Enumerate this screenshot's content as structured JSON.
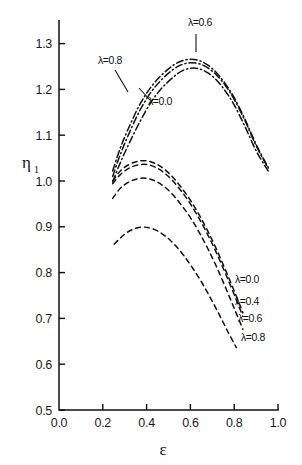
{
  "chart_data": {
    "type": "line",
    "title": "",
    "xlabel": "ε",
    "ylabel": "η",
    "ylabel_sub": "1",
    "xlim": [
      0.0,
      1.0
    ],
    "ylim": [
      0.5,
      1.35
    ],
    "xticks": [
      "0.0",
      "0.2",
      "0.4",
      "0.6",
      "0.8",
      "1.0"
    ],
    "xtick_values": [
      0.0,
      0.2,
      0.4,
      0.6,
      0.8,
      1.0
    ],
    "yticks": [
      "0.5",
      "0.6",
      "0.7",
      "0.8",
      "0.9",
      "1.0",
      "1.1",
      "1.2",
      "1.3"
    ],
    "ytick_values": [
      0.5,
      0.6,
      0.7,
      0.8,
      0.9,
      1.0,
      1.1,
      1.2,
      1.3
    ],
    "grid": false,
    "legend_position": "inline-annotations",
    "series": [
      {
        "name": "upper-lambda-0.8",
        "label": "λ=0.8",
        "style": "dash-dot",
        "group": "upper",
        "x": [
          0.245,
          0.28,
          0.32,
          0.37,
          0.42,
          0.47,
          0.52,
          0.56,
          0.6,
          0.64,
          0.68,
          0.72,
          0.76,
          0.8,
          0.85,
          0.9,
          0.955
        ],
        "y": [
          1.022,
          1.072,
          1.118,
          1.168,
          1.205,
          1.232,
          1.252,
          1.262,
          1.266,
          1.263,
          1.253,
          1.236,
          1.212,
          1.182,
          1.134,
          1.08,
          1.03
        ]
      },
      {
        "name": "upper-lambda-0.6",
        "label": "λ=0.6",
        "style": "dash-dot",
        "group": "upper",
        "x": [
          0.245,
          0.28,
          0.32,
          0.37,
          0.42,
          0.47,
          0.52,
          0.56,
          0.6,
          0.64,
          0.68,
          0.72,
          0.76,
          0.8,
          0.85,
          0.9,
          0.955
        ],
        "y": [
          1.01,
          1.058,
          1.104,
          1.155,
          1.194,
          1.222,
          1.243,
          1.254,
          1.258,
          1.256,
          1.247,
          1.231,
          1.208,
          1.178,
          1.131,
          1.077,
          1.028
        ]
      },
      {
        "name": "upper-lambda-0.0",
        "label": "λ=0.0",
        "style": "dash-dot",
        "group": "upper",
        "x": [
          0.245,
          0.28,
          0.32,
          0.37,
          0.42,
          0.47,
          0.52,
          0.56,
          0.6,
          0.64,
          0.68,
          0.72,
          0.76,
          0.8,
          0.85,
          0.9,
          0.955
        ],
        "y": [
          0.998,
          1.04,
          1.082,
          1.13,
          1.172,
          1.203,
          1.226,
          1.24,
          1.246,
          1.245,
          1.236,
          1.22,
          1.196,
          1.166,
          1.118,
          1.066,
          1.022
        ]
      },
      {
        "name": "lower-lambda-0.0",
        "label": "λ=0.0",
        "style": "dashed",
        "group": "lower",
        "x": [
          0.245,
          0.28,
          0.32,
          0.36,
          0.4,
          0.44,
          0.48,
          0.52,
          0.56,
          0.6,
          0.64,
          0.68,
          0.72,
          0.76,
          0.8,
          0.84
        ],
        "y": [
          1.0,
          1.022,
          1.036,
          1.043,
          1.044,
          1.038,
          1.026,
          1.008,
          0.985,
          0.958,
          0.926,
          0.89,
          0.85,
          0.806,
          0.76,
          0.712
        ]
      },
      {
        "name": "lower-lambda-0.4",
        "label": "λ=0.4",
        "style": "dashed",
        "group": "lower",
        "x": [
          0.245,
          0.28,
          0.32,
          0.36,
          0.4,
          0.44,
          0.48,
          0.52,
          0.56,
          0.6,
          0.64,
          0.68,
          0.72,
          0.76,
          0.8,
          0.84
        ],
        "y": [
          0.994,
          1.014,
          1.028,
          1.035,
          1.036,
          1.03,
          1.018,
          1.0,
          0.977,
          0.95,
          0.918,
          0.882,
          0.842,
          0.798,
          0.752,
          0.704
        ]
      },
      {
        "name": "lower-lambda-0.6",
        "label": "λ=0.6",
        "style": "dashed",
        "group": "lower",
        "x": [
          0.245,
          0.28,
          0.32,
          0.36,
          0.4,
          0.44,
          0.48,
          0.52,
          0.56,
          0.6,
          0.64,
          0.68,
          0.72,
          0.76,
          0.8,
          0.84
        ],
        "y": [
          0.962,
          0.984,
          0.998,
          1.005,
          1.006,
          1.0,
          0.988,
          0.97,
          0.947,
          0.92,
          0.888,
          0.852,
          0.812,
          0.768,
          0.722,
          0.676
        ]
      },
      {
        "name": "lower-lambda-0.8",
        "label": "λ=0.8",
        "style": "dashed",
        "group": "lower",
        "x": [
          0.252,
          0.29,
          0.33,
          0.37,
          0.41,
          0.45,
          0.49,
          0.53,
          0.57,
          0.61,
          0.65,
          0.69,
          0.73,
          0.77,
          0.81
        ],
        "y": [
          0.862,
          0.88,
          0.893,
          0.899,
          0.898,
          0.891,
          0.878,
          0.86,
          0.837,
          0.81,
          0.78,
          0.746,
          0.71,
          0.672,
          0.636
        ]
      }
    ],
    "annotations": [
      {
        "name": "ann-upper-lambda-0.6",
        "text": "λ=0.6",
        "x_px": 188,
        "y_px": 26,
        "leader": true
      },
      {
        "name": "ann-upper-lambda-0.8",
        "text": "λ=0.8",
        "x_px": 98,
        "y_px": 64,
        "leader": true
      },
      {
        "name": "ann-upper-lambda-0.0",
        "text": "λ=0.0",
        "x_px": 148,
        "y_px": 105,
        "leader": true
      },
      {
        "name": "ann-lower-lambda-0.0",
        "text": "λ=0.0",
        "x_px": 235,
        "y_px": 283,
        "leader": false
      },
      {
        "name": "ann-lower-lambda-0.4",
        "text": "λ=0.4",
        "x_px": 235,
        "y_px": 305,
        "leader": false
      },
      {
        "name": "ann-lower-lambda-0.6",
        "text": "λ=0.6",
        "x_px": 238,
        "y_px": 322,
        "leader": false
      },
      {
        "name": "ann-lower-lambda-0.8",
        "text": "λ=0.8",
        "x_px": 241,
        "y_px": 341,
        "leader": false
      }
    ]
  },
  "colors": {
    "ink": "#111111",
    "background": "#ffffff"
  }
}
